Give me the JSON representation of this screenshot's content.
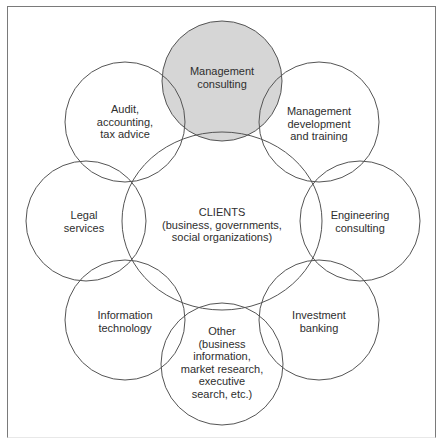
{
  "diagram": {
    "center": {
      "label": "CLIENTS\n(business, governments,\nsocial organizations)"
    },
    "nodes": [
      {
        "id": "management-consulting",
        "label": "Management\nconsulting",
        "highlighted": true
      },
      {
        "id": "management-development",
        "label": "Management\ndevelopment\nand training",
        "highlighted": false
      },
      {
        "id": "engineering-consulting",
        "label": "Engineering\nconsulting",
        "highlighted": false
      },
      {
        "id": "investment-banking",
        "label": "Investment\nbanking",
        "highlighted": false
      },
      {
        "id": "other",
        "label": "Other\n(business\ninformation,\nmarket research,\nexecutive\nsearch, etc.)",
        "highlighted": false
      },
      {
        "id": "information-technology",
        "label": "Information\ntechnology",
        "highlighted": false
      },
      {
        "id": "legal-services",
        "label": "Legal\nservices",
        "highlighted": false
      },
      {
        "id": "audit-accounting",
        "label": "Audit,\naccounting,\ntax advice",
        "highlighted": false
      }
    ],
    "colors": {
      "highlight_fill": "#d6d6d6",
      "stroke": "#555555",
      "text": "#2e2e2e"
    }
  }
}
